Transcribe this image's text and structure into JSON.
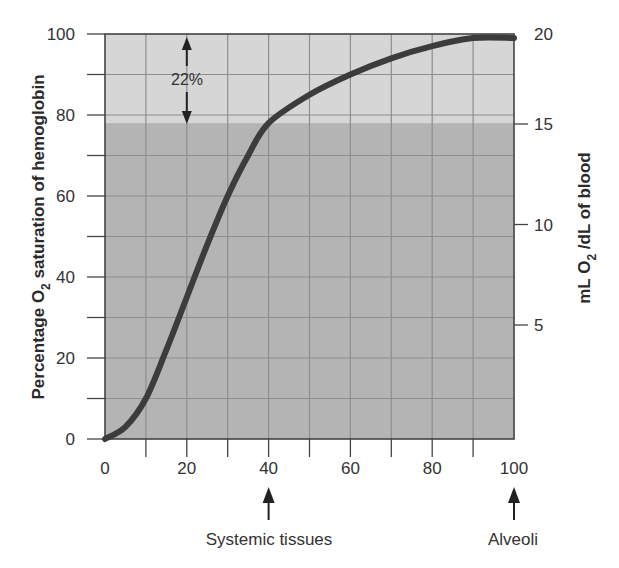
{
  "chart_data": {
    "type": "line",
    "title": "",
    "xlabel": "",
    "ylabel": "Percentage O2 saturation of hemoglobin",
    "y2label": "mL O2/dL of blood",
    "xlim": [
      0,
      100
    ],
    "ylim": [
      0,
      100
    ],
    "y2lim": [
      0,
      20
    ],
    "grid": true,
    "x_ticks": [
      0,
      20,
      40,
      60,
      80,
      100
    ],
    "y_ticks": [
      0,
      20,
      40,
      60,
      80,
      100
    ],
    "y2_ticks": [
      5,
      10,
      15,
      20
    ],
    "series": [
      {
        "name": "O2-hemoglobin dissociation curve",
        "x": [
          0,
          5,
          10,
          15,
          20,
          25,
          30,
          35,
          40,
          50,
          60,
          70,
          80,
          90,
          100
        ],
        "y": [
          0,
          3,
          10,
          22,
          35,
          48,
          60,
          70,
          78,
          85,
          90,
          94,
          97,
          99,
          99
        ]
      }
    ],
    "shaded_regions": [
      {
        "name": "unloaded-reserve",
        "y_from": 78,
        "y_to": 100,
        "color": "#d4d4d4"
      },
      {
        "name": "retained-O2",
        "y_from": 0,
        "y_to": 78,
        "color": "#b3b3b3"
      }
    ],
    "annotations": [
      {
        "text": "22%",
        "x": 20,
        "y": 89,
        "type": "double-arrow",
        "y_from": 78,
        "y_to": 100
      },
      {
        "text": "Systemic tissues",
        "x": 40,
        "type": "arrow-below-axis"
      },
      {
        "text": "Alveoli",
        "x": 100,
        "type": "arrow-below-axis"
      }
    ]
  },
  "labels": {
    "y_axis_left_main": "Percentage O",
    "y_axis_left_sub": "2",
    "y_axis_left_rest": " saturation of hemoglobin",
    "y_axis_right_main": "mL O",
    "y_axis_right_sub": "2",
    "y_axis_right_rest": " /dL of blood",
    "x_ticks": [
      "0",
      "20",
      "40",
      "60",
      "80",
      "100"
    ],
    "y_ticks": [
      "0",
      "20",
      "40",
      "60",
      "80",
      "100"
    ],
    "y2_ticks": [
      "5",
      "10",
      "15",
      "20"
    ],
    "annotation_22": "22%",
    "systemic_tissues": "Systemic tissues",
    "alveoli": "Alveoli"
  },
  "colors": {
    "upper_region": "#d6d6d6",
    "lower_region": "#b4b4b4",
    "grid": "#8e8e8e",
    "curve": "#3c3c3c",
    "axis": "#444444"
  }
}
